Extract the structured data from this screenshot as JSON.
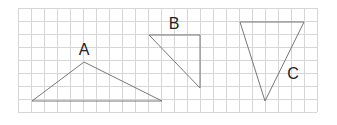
{
  "figure": {
    "width": 337,
    "height": 125,
    "grid": {
      "x0": 18,
      "y0": 8,
      "cell": 13,
      "cols": 23,
      "rows": 8,
      "color": "#d6d6d6"
    },
    "line_color": "#777777",
    "triangles": [
      {
        "label": "A",
        "points": "32,101 84,62 162,101",
        "label_x": 84,
        "label_y": 55
      },
      {
        "label": "B",
        "points": "149,35 200,35 200,88",
        "label_x": 174,
        "label_y": 29
      },
      {
        "label": "C",
        "points": "240,22 304,22 265,101",
        "label_x": 293,
        "label_y": 79
      }
    ]
  }
}
